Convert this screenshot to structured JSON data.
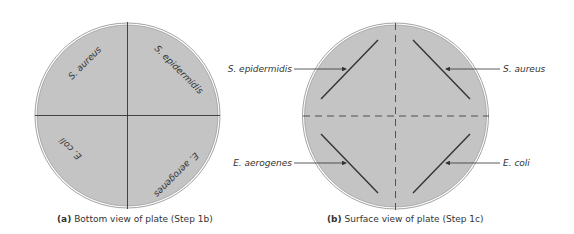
{
  "colors": {
    "plate_fill": "#c4c4c4",
    "plate_rim": "#8a8a8a",
    "line": "#333333",
    "text": "#333333",
    "background": "#ffffff"
  },
  "panel_a": {
    "caption_letter": "(a)",
    "caption_text": "Bottom view of plate (Step 1b)",
    "quadrant_labels": {
      "top_left": "S. aureus",
      "top_right": "S. epidermidis",
      "bottom_left": "E. coli",
      "bottom_right": "E. aerogenes"
    }
  },
  "panel_b": {
    "caption_letter": "(b)",
    "caption_text": "Surface view of plate (Step 1c)",
    "callouts": {
      "top_left": "S. epidermidis",
      "top_right": "S. aureus",
      "bottom_left": "E. aerogenes",
      "bottom_right": "E. coli"
    }
  }
}
